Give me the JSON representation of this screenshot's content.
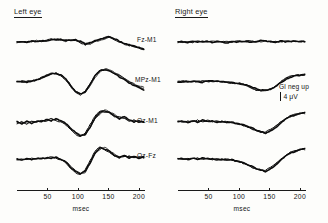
{
  "figure": {
    "panels": [
      {
        "id": "left",
        "title": "Left eye"
      },
      {
        "id": "right",
        "title": "Right eye"
      }
    ],
    "channels": [
      {
        "key": "fz_m1",
        "label": "Fz-M1"
      },
      {
        "key": "mpz_m1",
        "label": "MPz-M1"
      },
      {
        "key": "oz_m1",
        "label": "Oz-M1"
      },
      {
        "key": "oz_fz",
        "label": "Oz-Fz"
      }
    ],
    "scale": {
      "polarity_note": "Gl neg up",
      "amplitude": "4 μV"
    },
    "axis": {
      "caption": "msec",
      "tick_labels": [
        "50",
        "100",
        "150",
        "200"
      ]
    }
  },
  "chart_data": {
    "type": "line",
    "title": "",
    "xlabel": "msec",
    "ylabel": "4 μV",
    "xlim": [
      0,
      210
    ],
    "ylim": [
      -4,
      4
    ],
    "grid": false,
    "legend": "none",
    "annotations": [
      "Gl neg up",
      "4 μV"
    ],
    "x_ticks": [
      50,
      100,
      150,
      200
    ],
    "panels": [
      "Left eye",
      "Right eye"
    ],
    "channels": [
      "Fz-M1",
      "MPz-M1",
      "Oz-M1",
      "Oz-Fz"
    ],
    "traces_per_channel": 3,
    "note": "Superimposed repeat averages of pattern-reversal visual evoked potentials; negative plotted upward.",
    "x": [
      0,
      8,
      16,
      24,
      32,
      40,
      48,
      56,
      64,
      72,
      80,
      88,
      96,
      104,
      112,
      120,
      128,
      136,
      144,
      152,
      160,
      168,
      176,
      184,
      192,
      200,
      208
    ],
    "series": [
      {
        "name": "Left eye / Fz-M1 / run 1",
        "panel": "Left eye",
        "channel": "Fz-M1",
        "values": [
          0.0,
          0.1,
          -0.1,
          0.2,
          0.0,
          0.3,
          0.2,
          0.5,
          0.7,
          0.6,
          0.3,
          0.4,
          0.6,
          0.2,
          -0.4,
          -0.2,
          0.3,
          0.5,
          0.9,
          1.1,
          0.8,
          0.2,
          -0.3,
          -0.6,
          -0.9,
          -1.2,
          -1.5
        ]
      },
      {
        "name": "Left eye / Fz-M1 / run 2",
        "panel": "Left eye",
        "channel": "Fz-M1",
        "values": [
          0.1,
          -0.1,
          0.1,
          0.0,
          0.2,
          0.1,
          0.4,
          0.6,
          0.5,
          0.4,
          0.5,
          0.3,
          0.4,
          -0.1,
          -0.6,
          -0.3,
          0.2,
          0.6,
          1.0,
          0.9,
          0.5,
          0.0,
          -0.4,
          -0.8,
          -1.1,
          -1.4,
          -1.6
        ]
      },
      {
        "name": "Left eye / Fz-M1 / run 3",
        "panel": "Left eye",
        "channel": "Fz-M1",
        "values": [
          -0.1,
          0.2,
          0.0,
          0.1,
          0.3,
          0.2,
          0.3,
          0.4,
          0.6,
          0.5,
          0.2,
          0.5,
          0.3,
          0.0,
          -0.2,
          -0.5,
          0.1,
          0.4,
          0.7,
          1.0,
          0.6,
          0.1,
          -0.5,
          -0.7,
          -1.0,
          -1.3,
          -1.4
        ]
      },
      {
        "name": "Left eye / MPz-M1 / run 1",
        "panel": "Left eye",
        "channel": "MPz-M1",
        "values": [
          0.0,
          0.1,
          0.0,
          0.2,
          0.4,
          0.9,
          1.4,
          1.8,
          1.9,
          1.5,
          0.6,
          -0.8,
          -2.1,
          -2.6,
          -2.2,
          -0.6,
          1.3,
          2.4,
          2.6,
          2.3,
          1.8,
          1.2,
          0.5,
          -0.2,
          -0.8,
          -1.3,
          -1.6
        ]
      },
      {
        "name": "Left eye / MPz-M1 / run 2",
        "panel": "Left eye",
        "channel": "MPz-M1",
        "values": [
          0.1,
          0.0,
          0.1,
          0.3,
          0.5,
          1.0,
          1.5,
          1.9,
          1.8,
          1.3,
          0.4,
          -1.0,
          -2.3,
          -2.8,
          -2.0,
          -0.3,
          1.6,
          2.6,
          2.8,
          2.4,
          1.9,
          1.4,
          0.7,
          0.0,
          -0.6,
          -1.1,
          -1.4
        ]
      },
      {
        "name": "Left eye / MPz-M1 / run 3",
        "panel": "Left eye",
        "channel": "MPz-M1",
        "values": [
          0.0,
          0.2,
          0.1,
          0.1,
          0.3,
          0.8,
          1.3,
          1.7,
          2.0,
          1.6,
          0.7,
          -0.6,
          -1.9,
          -2.5,
          -2.4,
          -0.9,
          1.0,
          2.2,
          2.9,
          2.7,
          2.1,
          1.5,
          0.8,
          0.1,
          -0.5,
          -1.0,
          -1.2
        ]
      },
      {
        "name": "Left eye / Oz-M1 / run 1",
        "panel": "Left eye",
        "channel": "Oz-M1",
        "values": [
          0.3,
          -0.2,
          0.4,
          -0.1,
          0.5,
          0.2,
          0.8,
          0.4,
          1.0,
          0.6,
          0.0,
          -1.0,
          -2.2,
          -2.8,
          -2.4,
          -0.8,
          1.2,
          2.3,
          2.5,
          2.2,
          1.6,
          1.0,
          1.4,
          0.8,
          0.3,
          0.6,
          0.1
        ]
      },
      {
        "name": "Left eye / Oz-M1 / run 2",
        "panel": "Left eye",
        "channel": "Oz-M1",
        "values": [
          -0.2,
          0.4,
          -0.3,
          0.3,
          0.1,
          0.6,
          0.3,
          0.9,
          0.5,
          0.2,
          -0.4,
          -1.4,
          -2.5,
          -2.9,
          -2.1,
          -0.4,
          1.5,
          2.5,
          2.7,
          2.0,
          1.3,
          1.5,
          0.9,
          0.4,
          0.7,
          0.2,
          0.4
        ]
      },
      {
        "name": "Left eye / Oz-M1 / run 3",
        "panel": "Left eye",
        "channel": "Oz-M1",
        "values": [
          0.1,
          0.2,
          0.0,
          0.4,
          0.2,
          0.4,
          0.6,
          0.6,
          0.8,
          0.3,
          -0.2,
          -1.2,
          -2.0,
          -2.6,
          -2.6,
          -1.1,
          0.9,
          2.0,
          2.8,
          2.4,
          1.8,
          1.2,
          1.1,
          0.6,
          0.5,
          0.3,
          0.2
        ]
      },
      {
        "name": "Left eye / Oz-Fz / run 1",
        "panel": "Left eye",
        "channel": "Oz-Fz",
        "values": [
          0.2,
          0.0,
          0.3,
          0.1,
          0.4,
          0.2,
          0.5,
          0.3,
          0.7,
          0.2,
          -0.3,
          -1.5,
          -2.6,
          -3.0,
          -2.3,
          -0.5,
          1.6,
          2.6,
          2.4,
          1.8,
          1.0,
          0.6,
          1.0,
          0.5,
          0.9,
          0.4,
          0.7
        ]
      },
      {
        "name": "Left eye / Oz-Fz / run 2",
        "panel": "Left eye",
        "channel": "Oz-Fz",
        "values": [
          0.0,
          0.3,
          0.1,
          0.3,
          0.2,
          0.4,
          0.3,
          0.6,
          0.4,
          0.0,
          -0.6,
          -1.8,
          -2.8,
          -3.1,
          -2.0,
          -0.2,
          1.9,
          2.8,
          2.2,
          1.5,
          0.8,
          0.9,
          0.6,
          0.8,
          0.5,
          0.8,
          0.5
        ]
      },
      {
        "name": "Left eye / Oz-Fz / run 3",
        "panel": "Left eye",
        "channel": "Oz-Fz",
        "values": [
          0.1,
          0.1,
          0.2,
          0.2,
          0.3,
          0.3,
          0.4,
          0.4,
          0.5,
          0.1,
          -0.4,
          -1.3,
          -2.3,
          -2.9,
          -2.7,
          -0.9,
          1.3,
          2.4,
          2.7,
          2.0,
          1.2,
          0.7,
          0.8,
          0.9,
          0.6,
          0.6,
          0.6
        ]
      },
      {
        "name": "Right eye / Fz-M1 / run 1",
        "panel": "Right eye",
        "channel": "Fz-M1",
        "values": [
          0.0,
          0.1,
          -0.1,
          0.1,
          0.0,
          0.2,
          0.1,
          0.0,
          0.2,
          0.1,
          -0.1,
          0.1,
          0.0,
          0.2,
          0.1,
          0.0,
          0.2,
          0.3,
          0.1,
          0.2,
          0.0,
          0.2,
          0.1,
          0.0,
          0.1,
          0.0,
          0.1
        ]
      },
      {
        "name": "Right eye / Fz-M1 / run 2",
        "panel": "Right eye",
        "channel": "Fz-M1",
        "values": [
          0.1,
          -0.1,
          0.1,
          0.0,
          0.2,
          0.0,
          0.2,
          0.1,
          0.0,
          0.2,
          0.1,
          -0.1,
          0.2,
          0.0,
          0.3,
          0.1,
          0.0,
          0.2,
          0.3,
          0.0,
          0.2,
          0.0,
          0.2,
          0.1,
          0.0,
          0.1,
          0.0
        ]
      },
      {
        "name": "Right eye / Fz-M1 / run 3",
        "panel": "Right eye",
        "channel": "Fz-M1",
        "values": [
          -0.1,
          0.0,
          0.2,
          0.0,
          0.1,
          0.1,
          0.0,
          0.2,
          0.1,
          0.0,
          0.2,
          0.0,
          0.1,
          0.1,
          0.2,
          0.2,
          0.1,
          0.1,
          0.2,
          0.1,
          0.1,
          0.1,
          0.0,
          0.2,
          0.1,
          0.1,
          0.1
        ]
      },
      {
        "name": "Right eye / MPz-M1 / run 1",
        "panel": "Right eye",
        "channel": "MPz-M1",
        "values": [
          0.0,
          0.1,
          0.0,
          0.2,
          0.1,
          0.0,
          0.2,
          0.1,
          0.3,
          0.1,
          0.0,
          -0.1,
          -0.2,
          -0.4,
          -0.7,
          -1.1,
          -1.5,
          -1.8,
          -1.9,
          -1.6,
          -1.0,
          -0.2,
          0.5,
          1.0,
          1.3,
          1.5,
          1.6
        ]
      },
      {
        "name": "Right eye / MPz-M1 / run 2",
        "panel": "Right eye",
        "channel": "MPz-M1",
        "values": [
          0.1,
          0.0,
          0.2,
          0.0,
          0.2,
          0.2,
          0.1,
          0.3,
          0.1,
          0.0,
          -0.1,
          -0.3,
          -0.4,
          -0.6,
          -0.9,
          -1.3,
          -1.7,
          -2.0,
          -1.8,
          -1.4,
          -0.8,
          0.0,
          0.7,
          1.1,
          1.4,
          1.6,
          1.7
        ]
      },
      {
        "name": "Right eye / MPz-M1 / run 3",
        "panel": "Right eye",
        "channel": "MPz-M1",
        "values": [
          0.0,
          0.2,
          0.1,
          0.1,
          0.0,
          0.2,
          0.2,
          0.1,
          0.2,
          0.0,
          -0.2,
          -0.2,
          -0.3,
          -0.5,
          -0.8,
          -1.2,
          -1.6,
          -1.9,
          -2.0,
          -1.5,
          -0.9,
          -0.1,
          0.6,
          1.2,
          1.4,
          1.5,
          1.5
        ]
      },
      {
        "name": "Right eye / Oz-M1 / run 1",
        "panel": "Right eye",
        "channel": "Oz-M1",
        "values": [
          0.2,
          0.4,
          0.1,
          0.5,
          0.2,
          0.6,
          0.3,
          0.5,
          0.2,
          0.4,
          0.1,
          0.2,
          -0.1,
          -0.3,
          -0.6,
          -1.0,
          -1.5,
          -1.9,
          -2.1,
          -1.7,
          -1.0,
          -0.1,
          0.8,
          1.4,
          1.8,
          2.0,
          2.1
        ]
      },
      {
        "name": "Right eye / Oz-M1 / run 2",
        "panel": "Right eye",
        "channel": "Oz-M1",
        "values": [
          0.4,
          0.1,
          0.5,
          0.2,
          0.6,
          0.3,
          0.6,
          0.3,
          0.5,
          0.2,
          0.3,
          0.0,
          -0.2,
          -0.4,
          -0.8,
          -1.2,
          -1.7,
          -2.1,
          -1.9,
          -1.4,
          -0.7,
          0.2,
          1.0,
          1.6,
          1.9,
          2.1,
          2.2
        ]
      },
      {
        "name": "Right eye / Oz-M1 / run 3",
        "panel": "Right eye",
        "channel": "Oz-M1",
        "values": [
          0.3,
          0.3,
          0.3,
          0.4,
          0.4,
          0.4,
          0.4,
          0.4,
          0.3,
          0.3,
          0.2,
          0.1,
          -0.1,
          -0.4,
          -0.7,
          -1.1,
          -1.6,
          -2.0,
          -2.2,
          -1.6,
          -0.8,
          0.1,
          0.9,
          1.5,
          1.7,
          1.9,
          2.0
        ]
      },
      {
        "name": "Right eye / Oz-Fz / run 1",
        "panel": "Right eye",
        "channel": "Oz-Fz",
        "values": [
          0.2,
          0.3,
          0.1,
          0.4,
          0.2,
          0.4,
          0.2,
          0.3,
          0.1,
          0.2,
          0.0,
          0.1,
          -0.2,
          -0.5,
          -0.9,
          -1.3,
          -1.8,
          -2.2,
          -2.4,
          -1.9,
          -1.1,
          -0.1,
          0.8,
          1.5,
          1.9,
          2.2,
          2.3
        ]
      },
      {
        "name": "Right eye / Oz-Fz / run 2",
        "panel": "Right eye",
        "channel": "Oz-Fz",
        "values": [
          0.3,
          0.1,
          0.4,
          0.2,
          0.4,
          0.2,
          0.4,
          0.1,
          0.3,
          0.0,
          0.2,
          -0.1,
          -0.3,
          -0.6,
          -1.0,
          -1.5,
          -2.0,
          -2.3,
          -2.2,
          -1.6,
          -0.8,
          0.1,
          1.0,
          1.7,
          2.0,
          2.3,
          2.4
        ]
      },
      {
        "name": "Right eye / Oz-Fz / run 3",
        "panel": "Right eye",
        "channel": "Oz-Fz",
        "values": [
          0.2,
          0.2,
          0.3,
          0.3,
          0.3,
          0.3,
          0.3,
          0.2,
          0.2,
          0.1,
          0.1,
          0.0,
          -0.2,
          -0.4,
          -0.8,
          -1.4,
          -1.9,
          -2.3,
          -2.5,
          -1.8,
          -1.0,
          0.0,
          0.9,
          1.6,
          1.8,
          2.1,
          2.2
        ]
      }
    ]
  }
}
